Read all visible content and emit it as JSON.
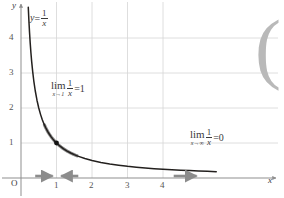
{
  "figure": {
    "width": 284,
    "height": 198,
    "background": "#ffffff"
  },
  "labels": {
    "axis_y": "y",
    "axis_x": "x",
    "origin": "O",
    "curve_equation": {
      "lhs": "y",
      "relation": "=",
      "numerator": "1",
      "denominator": "x"
    },
    "limit_at_one": {
      "operator": "lim",
      "subscript": "x→1",
      "numerator": "1",
      "denominator": "x",
      "relation": "=",
      "value": "1"
    },
    "limit_at_infinity": {
      "operator": "lim",
      "subscript": "x→∞",
      "numerator": "1",
      "denominator": "x",
      "relation": "=",
      "value": "0"
    }
  },
  "decoration": {
    "right_bracket": "("
  },
  "colors": {
    "curve": "#23201e",
    "highlight": "#8c8c8c",
    "arrow": "#8c8c8c",
    "grid": "#d6d6d6",
    "axis": "#8f8f8f",
    "text": "#3a3a3a",
    "tick_text": "#555555",
    "point": "#141414",
    "bracket": "#b9b9b9"
  },
  "chart_data": {
    "type": "line",
    "title": "",
    "subtitle": "",
    "xlabel": "x",
    "ylabel": "y",
    "function": "y = 1/x",
    "xlim": [
      -0.15,
      5.7
    ],
    "ylim": [
      -0.25,
      4.9
    ],
    "grid": true,
    "legend_position": "none",
    "x_ticks": [
      1,
      2,
      3,
      4
    ],
    "x_tick_labels": [
      "1",
      "2",
      "3",
      "4"
    ],
    "y_ticks": [
      1,
      2,
      3,
      4
    ],
    "y_tick_labels": [
      "1",
      "2",
      "3",
      "4"
    ],
    "series": [
      {
        "name": "y = 1/x",
        "color": "#23201e",
        "x": [
          0.205,
          0.22,
          0.24,
          0.26,
          0.28,
          0.3,
          0.33,
          0.36,
          0.4,
          0.45,
          0.5,
          0.55,
          0.6,
          0.65,
          0.7,
          0.75,
          0.8,
          0.85,
          0.9,
          0.95,
          1.0,
          1.1,
          1.2,
          1.3,
          1.4,
          1.5,
          1.6,
          1.8,
          2.0,
          2.25,
          2.5,
          2.75,
          3.0,
          3.25,
          3.5,
          3.75,
          4.0,
          4.25,
          4.5,
          4.75,
          5.0,
          5.25,
          5.5
        ],
        "y": [
          4.878,
          4.545,
          4.167,
          3.846,
          3.571,
          3.333,
          3.03,
          2.778,
          2.5,
          2.222,
          2.0,
          1.818,
          1.667,
          1.538,
          1.429,
          1.333,
          1.25,
          1.176,
          1.111,
          1.053,
          1.0,
          0.909,
          0.833,
          0.769,
          0.714,
          0.667,
          0.625,
          0.556,
          0.5,
          0.444,
          0.4,
          0.364,
          0.333,
          0.308,
          0.286,
          0.267,
          0.25,
          0.235,
          0.222,
          0.211,
          0.2,
          0.19,
          0.182
        ]
      }
    ],
    "highlighted_segments": [
      {
        "name": "approach-from-left",
        "x_start": 0.66,
        "x_end": 0.98,
        "color": "#8c8c8c"
      },
      {
        "name": "approach-from-right",
        "x_start": 1.02,
        "x_end": 1.58,
        "color": "#8c8c8c"
      }
    ],
    "points": [
      {
        "name": "limit-point",
        "x": 1,
        "y": 1,
        "color": "#141414",
        "label": ""
      }
    ],
    "axis_arrows": [
      {
        "name": "approach-one-from-left",
        "x_start": 0.4,
        "x_end": 0.88,
        "direction": "right"
      },
      {
        "name": "approach-one-from-right",
        "x_start": 1.6,
        "x_end": 1.12,
        "direction": "left"
      },
      {
        "name": "approach-infinity",
        "x_start": 4.3,
        "x_end": 4.95,
        "direction": "right"
      }
    ]
  }
}
